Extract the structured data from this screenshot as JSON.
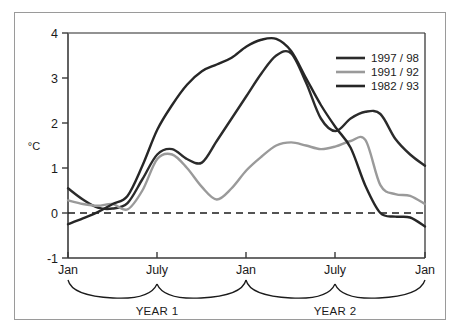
{
  "chart_data": {
    "type": "line",
    "title": "",
    "subtitle": "",
    "xlabel": "",
    "ylabel": "°C",
    "ylim": [
      -1,
      4
    ],
    "xlim": [
      0,
      24
    ],
    "grid": false,
    "legend_position": "top-right",
    "y_ticks": [
      "4",
      "3",
      "2",
      "1",
      "0",
      "-1"
    ],
    "y_tick_values": [
      4,
      3,
      2,
      1,
      0,
      -1
    ],
    "x_ticks": [
      "Jan",
      "July",
      "Jan",
      "July",
      "Jan"
    ],
    "x_tick_values": [
      0,
      6,
      12,
      18,
      24
    ],
    "zero_line": {
      "value": 0,
      "style": "dashed"
    },
    "period_brackets": [
      {
        "label": "YEAR 1",
        "from": 0,
        "to": 12
      },
      {
        "label": "YEAR 2",
        "from": 12,
        "to": 24
      }
    ],
    "series": [
      {
        "name": "1997 / 98",
        "color": "#2b2b2b",
        "x": [
          0,
          1,
          2,
          3,
          4,
          5,
          6,
          7,
          8,
          9,
          10,
          11,
          12,
          13,
          14,
          15,
          16,
          17,
          18,
          19,
          20,
          21,
          22,
          23,
          24
        ],
        "values": [
          0.55,
          0.3,
          0.12,
          0.1,
          0.22,
          0.75,
          1.3,
          1.42,
          1.2,
          1.12,
          1.6,
          2.1,
          2.6,
          3.1,
          3.5,
          3.55,
          2.9,
          2.1,
          1.82,
          2.1,
          2.25,
          2.2,
          1.65,
          1.3,
          1.05
        ]
      },
      {
        "name": "1991 / 92",
        "color": "#9a9a9a",
        "x": [
          0,
          1,
          2,
          3,
          4,
          5,
          6,
          7,
          8,
          9,
          10,
          11,
          12,
          13,
          14,
          15,
          16,
          17,
          18,
          19,
          20,
          21,
          22,
          23,
          24
        ],
        "values": [
          0.28,
          0.2,
          0.16,
          0.2,
          0.08,
          0.5,
          1.2,
          1.3,
          1.0,
          0.58,
          0.3,
          0.55,
          0.95,
          1.25,
          1.5,
          1.57,
          1.5,
          1.42,
          1.48,
          1.6,
          1.62,
          0.62,
          0.42,
          0.38,
          0.2
        ]
      },
      {
        "name": "1982 / 93",
        "color": "#262626",
        "x": [
          0,
          1,
          2,
          3,
          4,
          5,
          6,
          7,
          8,
          9,
          10,
          11,
          12,
          13,
          14,
          15,
          16,
          17,
          18,
          19,
          20,
          21,
          22,
          23,
          24
        ],
        "values": [
          -0.25,
          -0.12,
          0.02,
          0.2,
          0.38,
          1.05,
          1.85,
          2.4,
          2.85,
          3.15,
          3.3,
          3.45,
          3.7,
          3.85,
          3.87,
          3.6,
          3.0,
          2.4,
          1.9,
          1.45,
          0.6,
          0.0,
          -0.08,
          -0.1,
          -0.3
        ]
      }
    ],
    "annotations": []
  },
  "legend": {
    "entries": [
      {
        "label": "1997 / 98",
        "color": "#2b2b2b"
      },
      {
        "label": "1991 / 92",
        "color": "#9a9a9a"
      },
      {
        "label": "1982 / 93",
        "color": "#262626"
      }
    ]
  },
  "axes": {
    "y_title": "°C",
    "y_labels": [
      "4",
      "3",
      "2",
      "1",
      "0",
      "-1"
    ],
    "x_labels": [
      "Jan",
      "July",
      "Jan",
      "July",
      "Jan"
    ]
  },
  "brackets": {
    "year1": "YEAR 1",
    "year2": "YEAR 2"
  },
  "colors": {
    "series_dark_1": "#2b2b2b",
    "series_gray": "#9a9a9a",
    "series_dark_2": "#262626",
    "axis": "#3a3a3a",
    "frame": "#9a9a9a",
    "background": "#ffffff"
  }
}
